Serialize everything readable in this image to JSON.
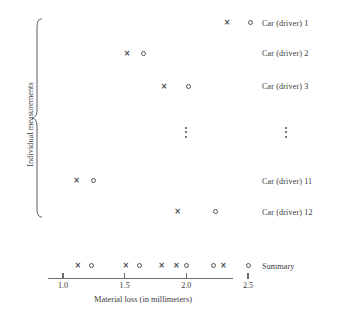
{
  "figure": {
    "group_label": "Individual measurements",
    "summary_label": "Summary",
    "x_axis_title": "Material loss (in millimeters)"
  },
  "chart_data": {
    "type": "scatter",
    "title": "",
    "xlabel": "Material loss (in millimeters)",
    "ylabel": "Individual measurements",
    "xlim": [
      0.95,
      2.6
    ],
    "xticks": [
      1.0,
      1.5,
      2.0,
      2.5
    ],
    "xticklabels": [
      "1.0",
      "1.5",
      "2.0",
      "2.5"
    ],
    "grid": false,
    "legend": null,
    "marker_kinds": [
      "cross",
      "circle"
    ],
    "rows": [
      {
        "label": "Car (driver) 1",
        "points": [
          {
            "marker": "cross",
            "x": 2.33
          },
          {
            "marker": "circle",
            "x": 2.52
          }
        ]
      },
      {
        "label": "Car (driver) 2",
        "points": [
          {
            "marker": "cross",
            "x": 1.52
          },
          {
            "marker": "circle",
            "x": 1.65
          }
        ]
      },
      {
        "label": "Car (driver) 3",
        "points": [
          {
            "marker": "cross",
            "x": 1.82
          },
          {
            "marker": "circle",
            "x": 2.02
          }
        ]
      },
      {
        "label": "⋮",
        "points": [],
        "ellipsis": true,
        "ellipsis_x": 2.0
      },
      {
        "label": "Car (driver) 11",
        "points": [
          {
            "marker": "cross",
            "x": 1.11
          },
          {
            "marker": "circle",
            "x": 1.25
          }
        ]
      },
      {
        "label": "Car (driver) 12",
        "points": [
          {
            "marker": "cross",
            "x": 1.93
          },
          {
            "marker": "circle",
            "x": 2.24
          }
        ]
      }
    ],
    "summary": {
      "label": "Summary",
      "points": [
        {
          "marker": "cross",
          "x": 1.12
        },
        {
          "marker": "circle",
          "x": 1.23
        },
        {
          "marker": "cross",
          "x": 1.51
        },
        {
          "marker": "circle",
          "x": 1.62
        },
        {
          "marker": "cross",
          "x": 1.8
        },
        {
          "marker": "cross",
          "x": 1.92
        },
        {
          "marker": "circle",
          "x": 2.0
        },
        {
          "marker": "circle",
          "x": 2.22
        },
        {
          "marker": "cross",
          "x": 2.3
        },
        {
          "marker": "circle",
          "x": 2.5
        }
      ]
    },
    "row_y_px": [
      22.7,
      53.3,
      86.0,
      132.0,
      180.7,
      211.7
    ],
    "summary_y_px": 265.5
  }
}
